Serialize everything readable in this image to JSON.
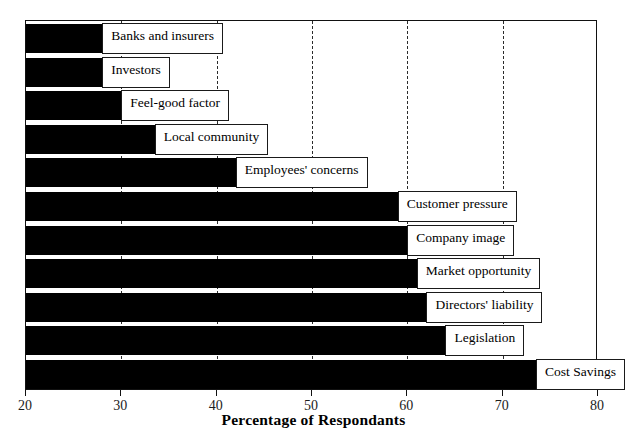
{
  "chart_data": {
    "type": "bar",
    "orientation": "horizontal",
    "title": "",
    "xlabel": "Percentage of Respondants",
    "ylabel": "",
    "xlim": [
      20,
      80
    ],
    "xticks": [
      20,
      30,
      40,
      50,
      60,
      70,
      80
    ],
    "xtick_labels": [
      "20",
      "30",
      "40",
      "50",
      "60",
      "70",
      "80"
    ],
    "grid": "vertical-dashed",
    "legend": "none",
    "bar_color": "#000000",
    "categories": [
      "Banks and insurers",
      "Investors",
      "Feel-good factor",
      "Local community",
      "Employees' concerns",
      "Customer pressure",
      "Company image",
      "Market opportunity",
      "Directors' liability",
      "Legislation",
      "Cost Savings"
    ],
    "values": [
      28,
      28,
      30,
      33.5,
      42,
      59,
      60,
      61,
      62,
      64,
      73.5
    ]
  },
  "bars": [
    {
      "label": "Banks and insurers",
      "value": 28
    },
    {
      "label": "Investors",
      "value": 28
    },
    {
      "label": "Feel-good factor",
      "value": 30
    },
    {
      "label": "Local community",
      "value": 33.5
    },
    {
      "label": "Employees' concerns",
      "value": 42
    },
    {
      "label": "Customer pressure",
      "value": 59
    },
    {
      "label": "Company image",
      "value": 60
    },
    {
      "label": "Market opportunity",
      "value": 61
    },
    {
      "label": "Directors' liability",
      "value": 62
    },
    {
      "label": "Legislation",
      "value": 64
    },
    {
      "label": "Cost Savings",
      "value": 73.5
    }
  ],
  "axis": {
    "x_title": "Percentage of Respondants",
    "ticks": [
      "20",
      "30",
      "40",
      "50",
      "60",
      "70",
      "80"
    ]
  }
}
